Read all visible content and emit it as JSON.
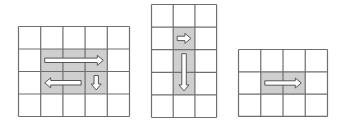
{
  "colors": {
    "line": "#6e6e6e",
    "shade": "#cfcfcf",
    "cell": "#ffffff",
    "arrow_fill": "#ffffff",
    "arrow_stroke": "#555555"
  },
  "grids": [
    {
      "name": "grid-5x4",
      "x": 18,
      "y": 26,
      "cols": 5,
      "rows": 4,
      "cell_w": 22.2,
      "cell_h": 22.5,
      "shaded": [
        [
          1,
          1
        ],
        [
          1,
          2
        ],
        [
          1,
          3
        ],
        [
          2,
          1
        ],
        [
          2,
          2
        ],
        [
          2,
          3
        ]
      ],
      "arrows": [
        {
          "name": "arrow-right-icon",
          "dir": "right",
          "row": 1,
          "from_col": 1,
          "to_col": 3
        },
        {
          "name": "arrow-left-icon",
          "dir": "left",
          "row": 2,
          "from_col": 1,
          "to_col": 2
        },
        {
          "name": "arrow-down-icon",
          "dir": "down",
          "col": 3,
          "from_row": 2,
          "to_row": 2
        }
      ]
    },
    {
      "name": "grid-3x5",
      "x": 151,
      "y": 4,
      "cols": 3,
      "rows": 5,
      "cell_w": 21.7,
      "cell_h": 22.6,
      "shaded": [
        [
          1,
          1
        ],
        [
          2,
          1
        ],
        [
          3,
          1
        ]
      ],
      "arrows": [
        {
          "name": "arrow-right-icon",
          "dir": "right",
          "row": 1,
          "from_col": 1,
          "to_col": 1
        },
        {
          "name": "arrow-down-icon",
          "dir": "down",
          "col": 1,
          "from_row": 2,
          "to_row": 3
        }
      ]
    },
    {
      "name": "grid-4x3",
      "x": 238,
      "y": 49,
      "cols": 4,
      "rows": 3,
      "cell_w": 22.25,
      "cell_h": 22.3,
      "shaded": [
        [
          1,
          1
        ],
        [
          1,
          2
        ]
      ],
      "arrows": [
        {
          "name": "arrow-right-icon",
          "dir": "right",
          "row": 1,
          "from_col": 1,
          "to_col": 2
        }
      ]
    }
  ]
}
